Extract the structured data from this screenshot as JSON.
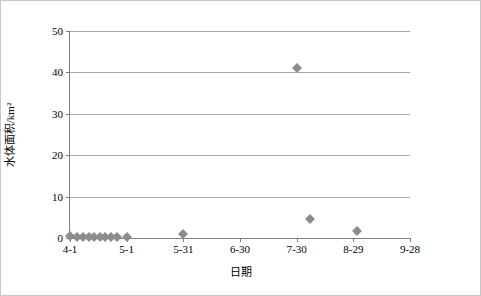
{
  "chart_data": {
    "type": "scatter",
    "title": "",
    "xlabel": "日期",
    "ylabel": "水体面积/km²",
    "ylim": [
      0,
      50
    ],
    "yticks": [
      0,
      10,
      20,
      30,
      40,
      50
    ],
    "xticks": [
      "4-1",
      "5-1",
      "5-31",
      "6-30",
      "7-30",
      "8-29",
      "9-28"
    ],
    "grid": true,
    "legend": "none",
    "x_axis_type": "date-like ordinal, ticks every 30 days",
    "points": [
      {
        "x": "4-1",
        "x_frac": 0.0,
        "y": 0.5
      },
      {
        "x": "4-5",
        "x_frac": 0.022,
        "y": 0.3
      },
      {
        "x": "4-8",
        "x_frac": 0.038,
        "y": 0.3
      },
      {
        "x": "4-11",
        "x_frac": 0.055,
        "y": 0.3
      },
      {
        "x": "4-14",
        "x_frac": 0.071,
        "y": 0.3
      },
      {
        "x": "4-17",
        "x_frac": 0.088,
        "y": 0.3
      },
      {
        "x": "4-20",
        "x_frac": 0.104,
        "y": 0.3
      },
      {
        "x": "4-23",
        "x_frac": 0.12,
        "y": 0.3
      },
      {
        "x": "4-26",
        "x_frac": 0.137,
        "y": 0.3
      },
      {
        "x": "5-1",
        "x_frac": 0.167,
        "y": 0.3
      },
      {
        "x": "5-31",
        "x_frac": 0.333,
        "y": 0.9
      },
      {
        "x": "7-30",
        "x_frac": 0.667,
        "y": 41.0
      },
      {
        "x": "8-6",
        "x_frac": 0.706,
        "y": 4.5
      },
      {
        "x": "8-31",
        "x_frac": 0.845,
        "y": 1.8
      }
    ]
  }
}
